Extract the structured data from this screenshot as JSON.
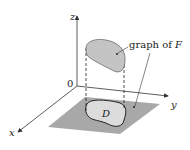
{
  "diagram": {
    "axes": {
      "x_label": "x",
      "y_label": "y",
      "z_label": "z",
      "origin_label": "0"
    },
    "annotations": {
      "surface_label_prefix": "graph of ",
      "surface_label_var": "F",
      "region_label": "D"
    },
    "colors": {
      "plane": "#a8a8a8",
      "region": "#dcdcdc",
      "surface": "#c4c4c4",
      "axis": "#333333"
    }
  }
}
